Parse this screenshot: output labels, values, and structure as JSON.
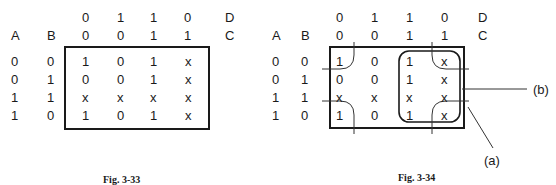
{
  "fig33": {
    "caption": "Fig. 3-33",
    "row_var_labels": [
      "A",
      "B"
    ],
    "col_var_labels": [
      "D",
      "C"
    ],
    "col_headers_d": [
      "0",
      "1",
      "1",
      "0"
    ],
    "col_headers_c": [
      "0",
      "0",
      "1",
      "1"
    ],
    "rows": [
      {
        "a": "0",
        "b": "0",
        "cells": [
          "1",
          "0",
          "1",
          "x"
        ]
      },
      {
        "a": "0",
        "b": "1",
        "cells": [
          "0",
          "0",
          "1",
          "x"
        ]
      },
      {
        "a": "1",
        "b": "1",
        "cells": [
          "x",
          "x",
          "x",
          "x"
        ]
      },
      {
        "a": "1",
        "b": "0",
        "cells": [
          "1",
          "0",
          "1",
          "x"
        ]
      }
    ]
  },
  "fig34": {
    "caption": "Fig. 3-34",
    "row_var_labels": [
      "A",
      "B"
    ],
    "col_var_labels": [
      "D",
      "C"
    ],
    "col_headers_d": [
      "0",
      "1",
      "1",
      "0"
    ],
    "col_headers_c": [
      "0",
      "0",
      "1",
      "1"
    ],
    "rows": [
      {
        "a": "0",
        "b": "0",
        "cells": [
          "1",
          "0",
          "1",
          "x"
        ]
      },
      {
        "a": "0",
        "b": "1",
        "cells": [
          "0",
          "0",
          "1",
          "x"
        ]
      },
      {
        "a": "1",
        "b": "1",
        "cells": [
          "x",
          "x",
          "x",
          "x"
        ]
      },
      {
        "a": "1",
        "b": "0",
        "cells": [
          "1",
          "0",
          "1",
          "x"
        ]
      }
    ],
    "annotations": {
      "group_a": "(a)",
      "group_b": "(b)"
    }
  }
}
